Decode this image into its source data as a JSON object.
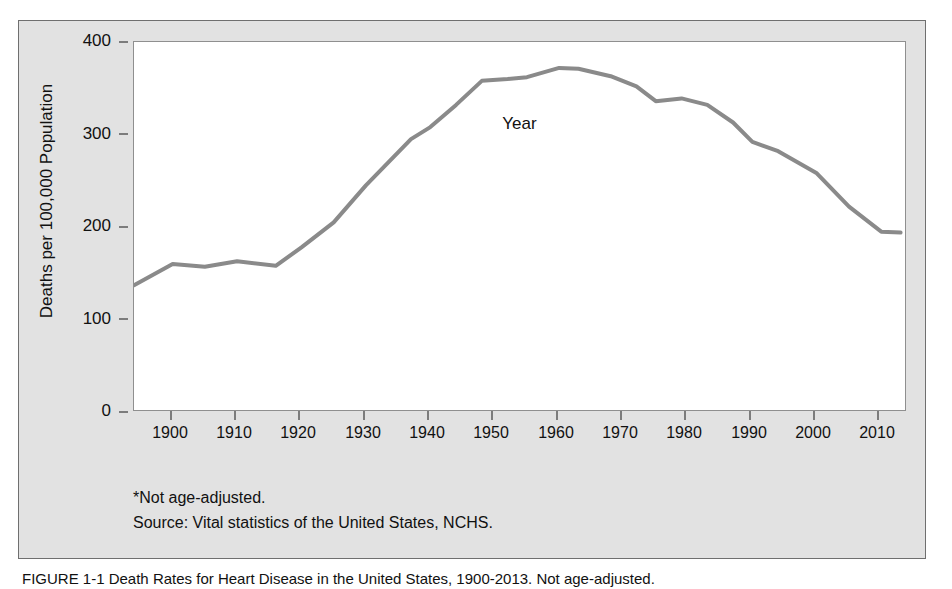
{
  "chart_data": {
    "type": "line",
    "title": "",
    "xlabel": "Year",
    "ylabel": "Deaths per 100,000 Population",
    "xlim": [
      1894,
      2014
    ],
    "ylim": [
      0,
      400
    ],
    "xticks": [
      1900,
      1910,
      1920,
      1930,
      1940,
      1950,
      1960,
      1970,
      1980,
      1990,
      2000,
      2010
    ],
    "yticks": [
      0,
      100,
      200,
      300,
      400
    ],
    "grid": false,
    "legend": "none",
    "line_color": "#8a8a8a",
    "series": [
      {
        "name": "Heart disease death rate",
        "x": [
          1894,
          1900,
          1905,
          1910,
          1916,
          1920,
          1925,
          1930,
          1937,
          1940,
          1944,
          1948,
          1952,
          1955,
          1960,
          1963,
          1968,
          1972,
          1975,
          1979,
          1983,
          1987,
          1990,
          1994,
          2000,
          2005,
          2010,
          2013
        ],
        "values": [
          137,
          160,
          157,
          163,
          158,
          178,
          205,
          245,
          295,
          308,
          332,
          358,
          360,
          362,
          372,
          371,
          363,
          352,
          336,
          339,
          332,
          313,
          292,
          282,
          258,
          222,
          195,
          194
        ]
      }
    ],
    "footnotes": [
      "*Not age-adjusted.",
      "Source: Vital statistics of the United States, NCHS."
    ]
  },
  "axis": {
    "y_title": "Deaths per 100,000 Population",
    "x_title": "Year",
    "y_labels": [
      "400",
      "300",
      "200",
      "100",
      "0"
    ],
    "x_labels": [
      "1900",
      "1910",
      "1920",
      "1930",
      "1940",
      "1950",
      "1960",
      "1970",
      "1980",
      "1990",
      "2000",
      "2010"
    ]
  },
  "footnotes": {
    "line1": "*Not age-adjusted.",
    "line2": "Source: Vital statistics of the United States, NCHS."
  },
  "caption": {
    "text": "FIGURE 1-1  Death Rates for Heart Disease in the United States, 1900-2013. Not age-adjusted."
  }
}
